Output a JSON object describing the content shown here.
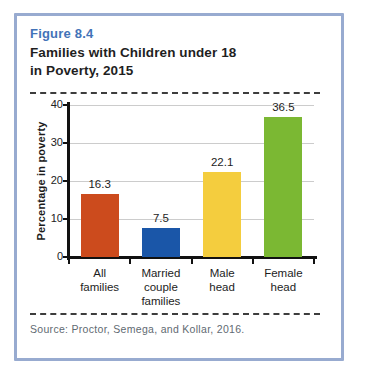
{
  "figure": {
    "number": "Figure 8.4",
    "title": "Families with Children under 18\nin Poverty, 2015"
  },
  "source": "Source: Proctor, Semega, and Kollar, 2016.",
  "colors": {
    "box_border": "#98abd0",
    "figure_number_text": "#4273b8",
    "title_text": "#1f1f1f",
    "axis": "#111111",
    "gridline": "#cccccc",
    "source_text": "#5f6a72",
    "bar_colors": [
      "#cc4b1d",
      "#1a56a8",
      "#f4cd3e",
      "#7bb833"
    ]
  },
  "chart_data": {
    "type": "bar",
    "title": "Families with Children under 18 in Poverty, 2015",
    "categories": [
      "All\nfamilies",
      "Married\ncouple\nfamilies",
      "Male\nhead",
      "Female\nhead"
    ],
    "values": [
      16.3,
      7.5,
      22.1,
      36.5
    ],
    "value_labels": [
      "16.3",
      "7.5",
      "22.1",
      "36.5"
    ],
    "xlabel": "",
    "ylabel": "Percentage in poverty",
    "ylim": [
      0,
      40
    ],
    "yticks": [
      0,
      10,
      20,
      30,
      40
    ],
    "grid": true,
    "legend": false
  }
}
